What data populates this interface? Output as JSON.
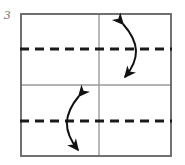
{
  "figure": {
    "label": "3",
    "kind": "paper-folding-diagram"
  },
  "colors": {
    "background": "#ffffff",
    "outer_border": "#6a6a6a",
    "inner_solid_line": "#9a9a9a",
    "dashed_line": "#1a1a1a",
    "arrow": "#111111",
    "label_text": "#6e6e6e"
  },
  "geometry": {
    "sheet": {
      "x": 20,
      "y": 13,
      "width": 152,
      "height": 144,
      "border_width": 2
    },
    "center_vertical_x": 99,
    "center_horizontal_y": 85
  },
  "solid_lines": [
    {
      "name": "center-vertical-line",
      "orientation": "vertical",
      "x": 99,
      "y1": 13,
      "y2": 157
    },
    {
      "name": "center-horizontal-line",
      "orientation": "horizontal",
      "y": 85,
      "x1": 20,
      "x2": 172
    }
  ],
  "dashed_lines": [
    {
      "name": "upper-fold-line",
      "orientation": "horizontal",
      "y": 49,
      "x1": 20,
      "x2": 172,
      "dash_pattern": "9 6",
      "stroke_width": 3
    },
    {
      "name": "lower-fold-line",
      "orientation": "horizontal",
      "y": 121,
      "x1": 20,
      "x2": 172,
      "dash_pattern": "9 6",
      "stroke_width": 3
    }
  ],
  "arrows": [
    {
      "name": "upper-right-fold-arrow",
      "quadrant": "upper-right",
      "double_headed": true,
      "bulge_direction": "right",
      "path": "M 122 22 C 140 42, 140 58, 124 79",
      "head_top": {
        "x": 122,
        "y": 22,
        "angle_deg": -48
      },
      "head_bottom": {
        "x": 124,
        "y": 79,
        "angle_deg": 128
      },
      "stroke_width": 2
    },
    {
      "name": "lower-left-fold-arrow",
      "quadrant": "lower-left",
      "double_headed": true,
      "bulge_direction": "left",
      "path": "M 78 94 C 62 114, 62 130, 78 152",
      "head_top": {
        "x": 78,
        "y": 94,
        "angle_deg": -52
      },
      "head_bottom": {
        "x": 78,
        "y": 152,
        "angle_deg": 125
      },
      "stroke_width": 2
    }
  ]
}
